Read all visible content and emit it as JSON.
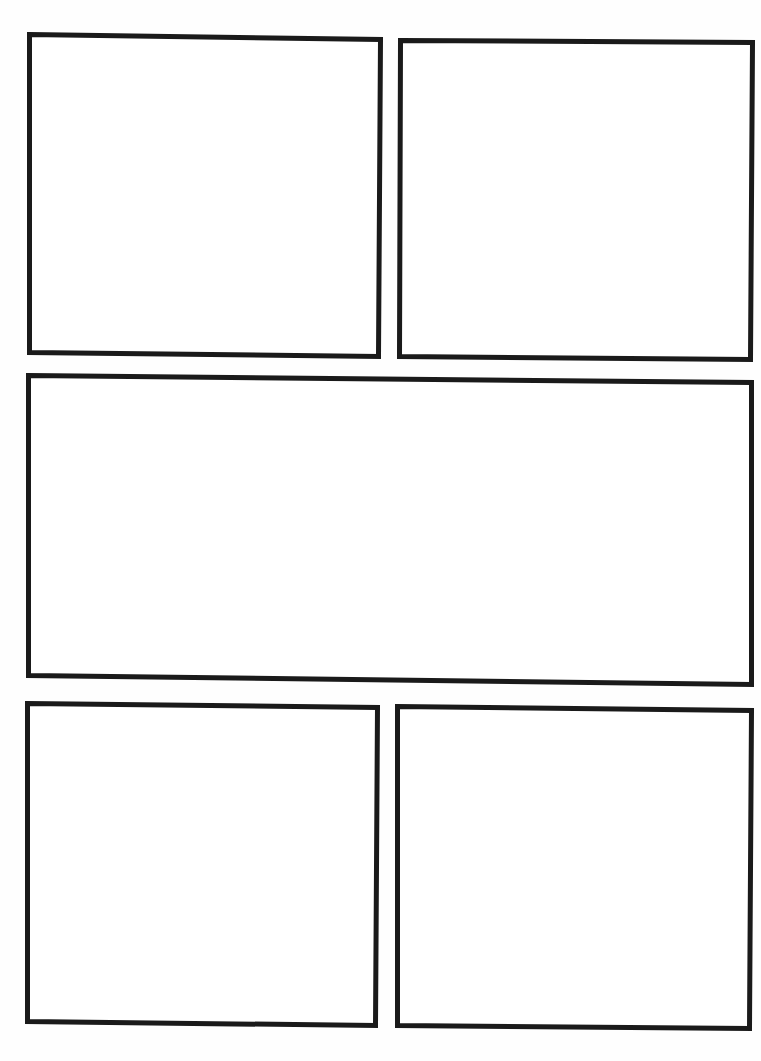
{
  "page": {
    "type": "comic-page-template",
    "background_color": "#ffffff",
    "border_color": "#1a1a1a",
    "border_width": 5
  },
  "panels": [
    {
      "id": "panel-1",
      "row": 1,
      "position": "left",
      "points": "29.5,34.5 380.5,39.5 378.5,356.5 29.5,352.5"
    },
    {
      "id": "panel-2",
      "row": 1,
      "position": "right",
      "points": "400.5,40.5 752.5,42.5 750.5,359.5 399.5,356.5"
    },
    {
      "id": "panel-3",
      "row": 2,
      "position": "full",
      "points": "28.5,375.5 751.5,382.5 751.5,684.5 28.5,675.5"
    },
    {
      "id": "panel-4",
      "row": 3,
      "position": "left",
      "points": "27.5,703.5 377.5,707.5 375.5,1025.5 27.5,1021.5"
    },
    {
      "id": "panel-5",
      "row": 3,
      "position": "right",
      "points": "397.5,706.5 751.5,710.5 749.5,1028.5 397.5,1025.5"
    }
  ]
}
